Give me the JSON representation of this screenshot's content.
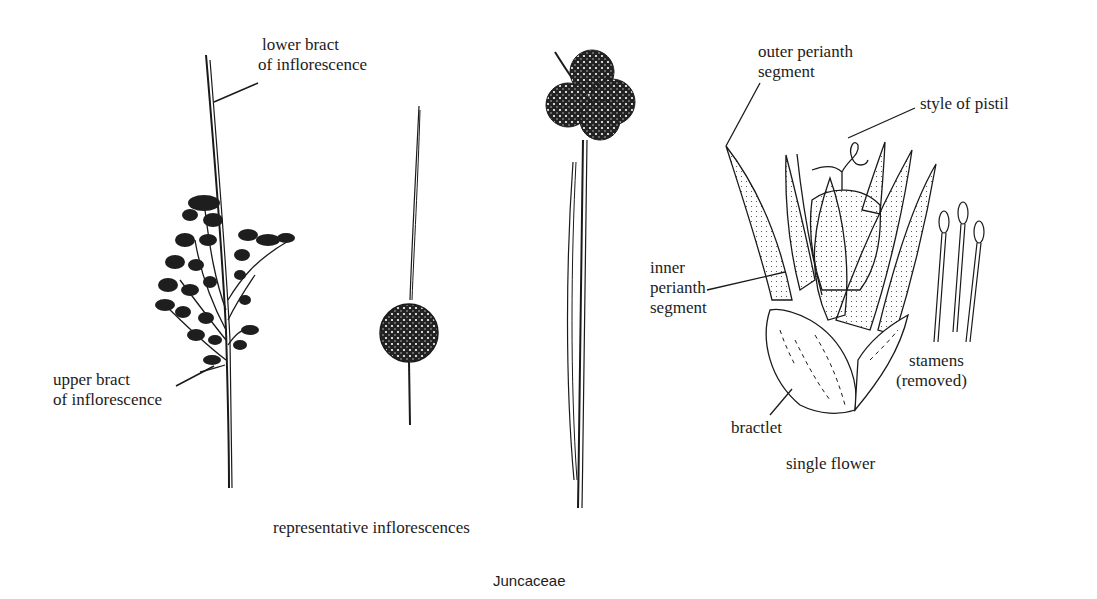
{
  "figure": {
    "title": "Juncaceae",
    "colors": {
      "ink": "#1a1a1a",
      "background": "#ffffff"
    },
    "groups": [
      {
        "caption": "representative inflorescences",
        "drawings": [
          "branched-panicle-inflorescence",
          "single-globose-head-inflorescence",
          "clustered-heads-inflorescence"
        ]
      },
      {
        "caption": "single flower",
        "drawings": [
          "flower-detail",
          "stamens-detail"
        ]
      }
    ],
    "labels": {
      "lower_bract_1": "lower bract",
      "lower_bract_2": "of inflorescence",
      "upper_bract_1": "upper bract",
      "upper_bract_2": "of inflorescence",
      "outer_perianth_1": "outer perianth",
      "outer_perianth_2": "segment",
      "style_of_pistil": "style of pistil",
      "inner_perianth_1": "inner",
      "inner_perianth_2": "perianth",
      "inner_perianth_3": "segment",
      "stamens_1": "stamens",
      "stamens_2": "(removed)",
      "bractlet": "bractlet"
    }
  }
}
